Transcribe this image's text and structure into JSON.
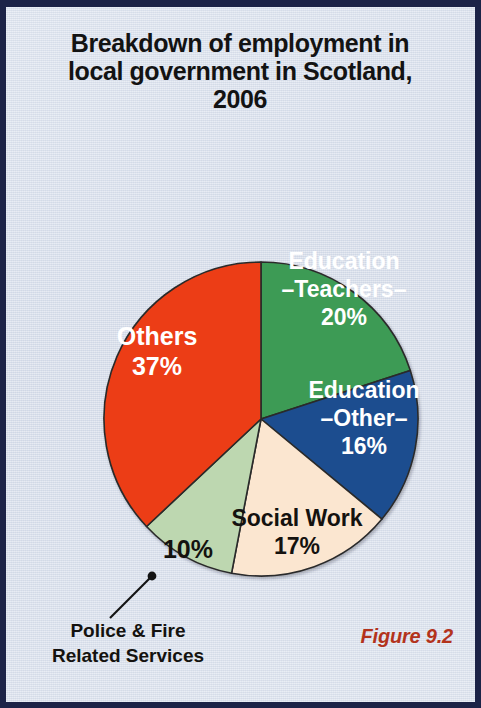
{
  "figure": {
    "title": "Breakdown of employment in local government in Scotland, 2006",
    "title_line1": "Breakdown of employment in",
    "title_line2": "local government in Scotland,",
    "title_line3": "2006",
    "caption": "Figure 9.2",
    "frame_border_color": "#1c2347",
    "background_color": "#d9e0ed",
    "caption_color": "#b3331c"
  },
  "chart_data": {
    "type": "pie",
    "title": "Breakdown of employment in local government in Scotland, 2006",
    "xlabel": "",
    "ylabel": "",
    "units": "percent",
    "total": 100,
    "start_angle_deg": 0,
    "direction": "clockwise",
    "legend_position": "none",
    "grid": false,
    "categories": [
      "Education –Teachers–",
      "Education –Other–",
      "Social Work",
      "Police & Fire Related Services",
      "Others"
    ],
    "values": [
      20,
      16,
      17,
      10,
      37
    ],
    "colors": [
      "#3d9b54",
      "#1d4e8f",
      "#fbe6d0",
      "#bdd7b0",
      "#ec3d13"
    ],
    "slices": [
      {
        "name": "education-teachers",
        "label_line1": "Education",
        "label_line2": "–Teachers–",
        "value_label": "20%",
        "value": 20,
        "color": "#3d9b54",
        "text_color": "#ffffff",
        "label_placement": "inside"
      },
      {
        "name": "education-other",
        "label_line1": "Education",
        "label_line2": "–Other–",
        "value_label": "16%",
        "value": 16,
        "color": "#1d4e8f",
        "text_color": "#ffffff",
        "label_placement": "inside"
      },
      {
        "name": "social-work",
        "label_line1": "Social Work",
        "label_line2": "",
        "value_label": "17%",
        "value": 17,
        "color": "#fbe6d0",
        "text_color": "#14120f",
        "label_placement": "inside"
      },
      {
        "name": "police-fire",
        "label_line1": "Police & Fire",
        "label_line2": "Related Services",
        "value_label": "10%",
        "value": 10,
        "color": "#bdd7b0",
        "text_color": "#14120f",
        "label_placement": "callout"
      },
      {
        "name": "others",
        "label_line1": "Others",
        "label_line2": "",
        "value_label": "37%",
        "value": 37,
        "color": "#ec3d13",
        "text_color": "#ffffff",
        "label_placement": "inside"
      }
    ]
  }
}
